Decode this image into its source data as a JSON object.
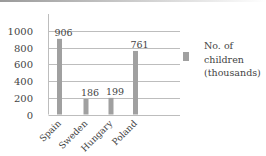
{
  "chart_data": {
    "type": "bar",
    "title": "",
    "xlabel": "",
    "ylabel": "",
    "categories": [
      "Spain",
      "Sweden",
      "Hungary",
      "Poland"
    ],
    "series": [
      {
        "name": "No. of children (thousands)",
        "values": [
          906,
          186,
          199,
          761
        ],
        "color": "#a0a0a0"
      }
    ],
    "value_labels": [
      "906",
      "186",
      "199",
      "761"
    ],
    "y_ticks": [
      0,
      200,
      400,
      600,
      800,
      1000
    ],
    "y_tick_labels": [
      "0",
      "200",
      "400",
      "600",
      "800",
      "1000"
    ],
    "ylim": [
      0,
      1000
    ],
    "grid": true,
    "legend_position": "right"
  },
  "legend": {
    "lines": [
      "No. of",
      "children",
      "(thousands)"
    ]
  }
}
